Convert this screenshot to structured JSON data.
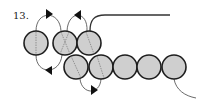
{
  "diagram": {
    "step_label": "13.",
    "bead_fill": "#cfcfcf",
    "bead_stroke": "#1e1e1e",
    "thread_color": "#444444",
    "top_row": [
      {
        "cx": 36,
        "cy": 43,
        "thread": "vertical"
      },
      {
        "cx": 65,
        "cy": 43,
        "thread": "cross"
      },
      {
        "cx": 89,
        "cy": 43,
        "thread": "diagonal"
      }
    ],
    "bottom_row": [
      {
        "cx": 76,
        "cy": 67,
        "thread": "diagonal"
      },
      {
        "cx": 101,
        "cy": 67,
        "thread": "diagonal"
      },
      {
        "cx": 125,
        "cy": 67,
        "thread": "none"
      },
      {
        "cx": 149,
        "cy": 67,
        "thread": "none"
      },
      {
        "cx": 174,
        "cy": 67,
        "thread": "none"
      }
    ],
    "bead_radius": 12
  }
}
